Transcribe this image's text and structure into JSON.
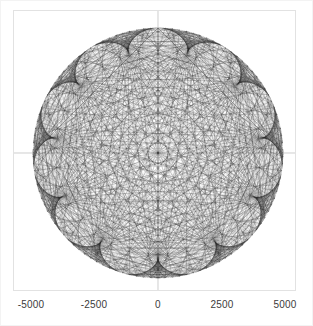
{
  "figure": {
    "background_color": "#ffffff",
    "frame_color": "#e2e2e2",
    "axis_color": "#b9b9b9",
    "line_color": "#2a2a2a",
    "width": 313,
    "height": 326
  },
  "axes": {
    "x_axis_label": "",
    "y_axis_label": "",
    "title": "",
    "x_ticks": [
      {
        "value": -5000,
        "label": "-5000",
        "pixel_x": 31
      },
      {
        "value": -2500,
        "label": "-2500",
        "pixel_x": 94
      },
      {
        "value": 0,
        "label": "0",
        "pixel_x": 158
      },
      {
        "value": 2500,
        "label": "2500",
        "pixel_x": 222
      },
      {
        "value": 5000,
        "label": "5000",
        "pixel_x": 285
      }
    ],
    "y_ticks": [],
    "xlim": [
      -5600,
      5600
    ],
    "ylim": [
      -5600,
      5600
    ],
    "grid": false,
    "origin_crosshair": true
  },
  "chart_data": {
    "type": "scatter",
    "plot_style": "modular-multiplication-chord-diagram",
    "title": "",
    "xlabel": "",
    "ylabel": "",
    "xlim": [
      -5600,
      5600
    ],
    "ylim": [
      -5600,
      5600
    ],
    "grid": false,
    "legend": null,
    "radius": 5000,
    "num_points": 440,
    "multiplier": 12,
    "star_points": 11,
    "series": [
      {
        "name": "chords",
        "color": "#2a2a2a",
        "opacity": 0.42,
        "line_width": 0.35,
        "count": 440
      }
    ],
    "annotations": []
  }
}
